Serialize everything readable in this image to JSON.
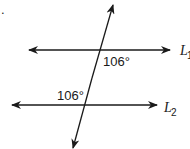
{
  "figure": {
    "marker": ".",
    "lines": [
      {
        "name": "L1",
        "label": "L",
        "subscript": "1"
      },
      {
        "name": "L2",
        "label": "L",
        "subscript": "2"
      }
    ],
    "angles": [
      {
        "label": "106°",
        "position": "below L1, right of transversal"
      },
      {
        "label": "106°",
        "position": "above L2, left of transversal"
      }
    ],
    "colors": {
      "stroke": "#1a1a1a",
      "background": "#ffffff"
    }
  }
}
